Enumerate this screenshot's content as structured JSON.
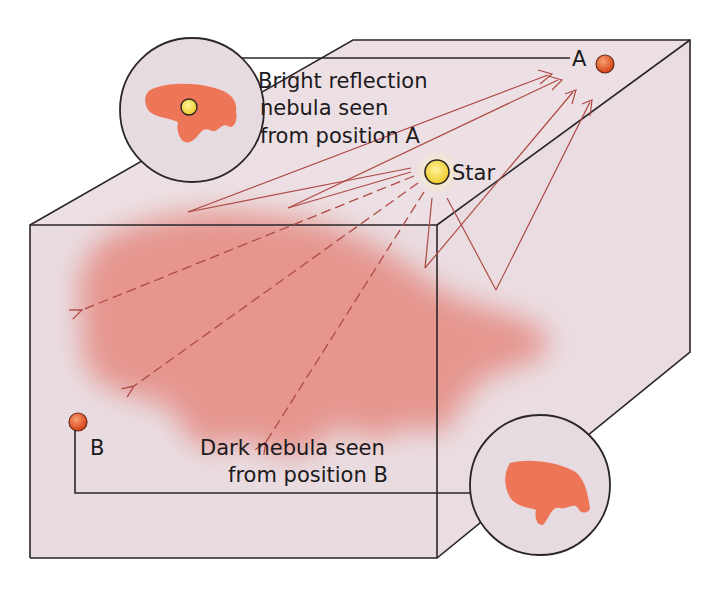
{
  "diagram": {
    "type": "reflection-vs-dark-nebula-illustration",
    "colors": {
      "box_face": "#eddfe3",
      "box_edge": "#2a2628",
      "nebula": "#e3877c",
      "nebula_inset": "#ee7658",
      "ray": "#b04a44",
      "star": "#f4d63c",
      "observer": "#e05a26"
    },
    "labels": {
      "inset_a_line1": "Bright reflection",
      "inset_a_line2": "nebula seen",
      "inset_a_line3": "from position A",
      "star": "Star",
      "position_a": "A",
      "position_b": "B",
      "inset_b_line1": "Dark nebula seen",
      "inset_b_line2": "from  position B"
    }
  }
}
